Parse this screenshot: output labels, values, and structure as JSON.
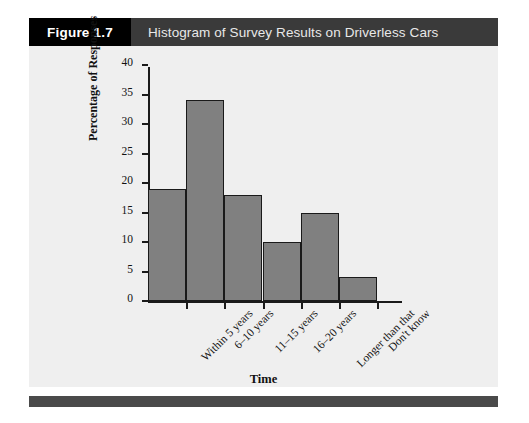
{
  "header": {
    "figure_number": "Figure 1.7",
    "title": "Histogram of Survey Results on Driverless Cars",
    "number_block_color": "#000000",
    "title_block_color": "#3a3a3a",
    "title_text_color": "#e8e8e8"
  },
  "panel": {
    "background_color": "#efefef"
  },
  "footer": {
    "color": "#4a4a4a"
  },
  "chart_data": {
    "type": "bar",
    "title": "Histogram of Survey Results on Driverless Cars",
    "categories": [
      "Within 5 years",
      "6–10 years",
      "11–15 years",
      "16–20 years",
      "Longer than that",
      "Don't know"
    ],
    "values": [
      19,
      34,
      18,
      10,
      15,
      4
    ],
    "xlabel": "Time",
    "ylabel": "Percentage of Responses",
    "ylim": [
      0,
      40
    ],
    "ytick_step": 5,
    "yticks": [
      0,
      5,
      10,
      15,
      20,
      25,
      30,
      35,
      40
    ],
    "ytick_labels": [
      "0",
      "5",
      "10",
      "15",
      "20",
      "25",
      "30",
      "35",
      "40"
    ],
    "grid": false,
    "legend": null,
    "bar_fill_color": "#808080",
    "bar_edge_color": "#1a1a1a",
    "bar_gap": 0,
    "xtick_label_rotation": -45
  }
}
